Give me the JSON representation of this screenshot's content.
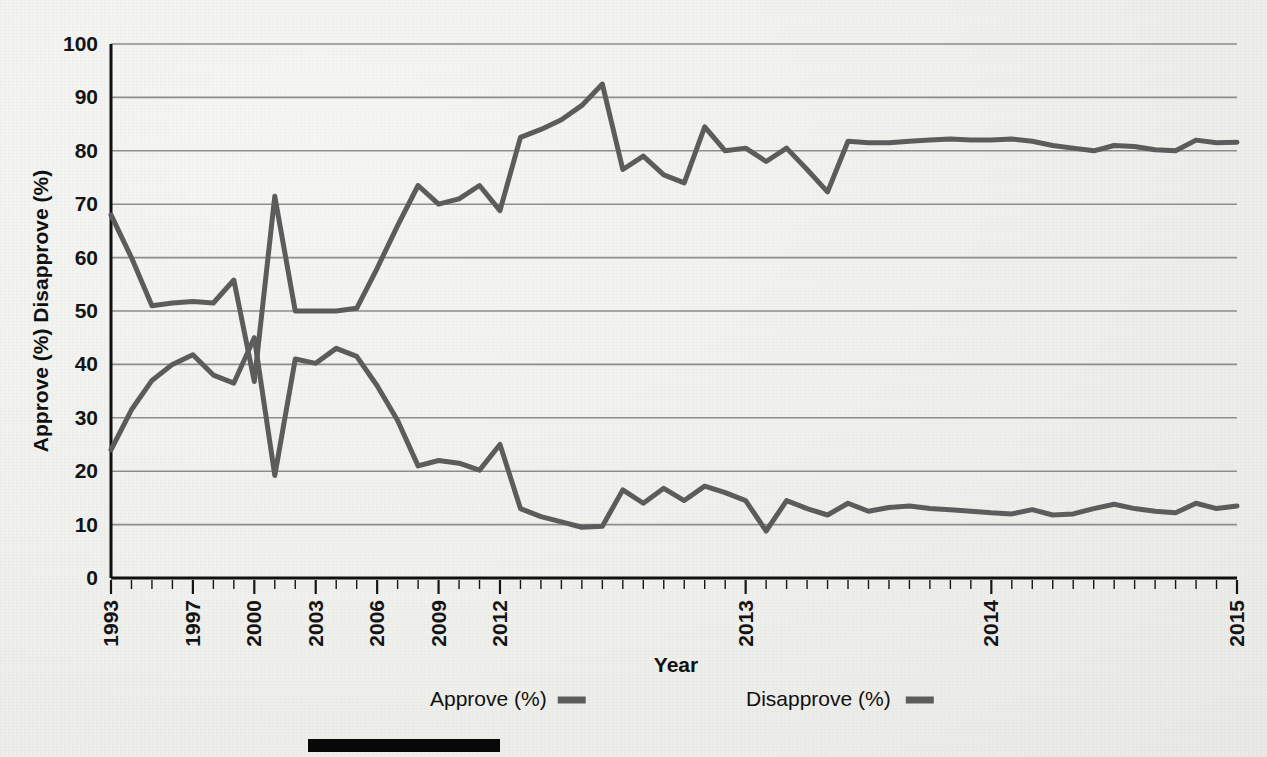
{
  "axes": {
    "y_label": "Approve (%) Disapprove (%)",
    "x_label": "Year",
    "y_ticks": [
      "0",
      "10",
      "20",
      "30",
      "40",
      "50",
      "60",
      "70",
      "80",
      "90",
      "100"
    ],
    "x_ticks": [
      "1993",
      "1997",
      "2000",
      "2003",
      "2006",
      "2009",
      "2012",
      "2013",
      "2014",
      "2015"
    ]
  },
  "legend": {
    "items": [
      {
        "label": "Approve (%)",
        "color": "#5c5c5c"
      },
      {
        "label": "Disapprove (%)",
        "color": "#5c5c5c"
      }
    ]
  },
  "colors": {
    "line": "#5c5c5c",
    "grid": "#8d8d8d",
    "axis": "#111111",
    "background": "#f1f1ee",
    "bottom_bar": "#080808"
  },
  "chart_data": {
    "type": "line",
    "title": "",
    "xlabel": "Year",
    "ylabel": "Approve (%) Disapprove (%)",
    "ylim": [
      0,
      100
    ],
    "ytick_step": 10,
    "grid": true,
    "legend_position": "bottom",
    "x_tick_labels": [
      "1993",
      "1997",
      "2000",
      "2003",
      "2006",
      "2009",
      "2012",
      "2013",
      "2014",
      "2015"
    ],
    "x_tick_indices": [
      0,
      4,
      7,
      10,
      13,
      16,
      19,
      31,
      43,
      55
    ],
    "n_points": 56,
    "series": [
      {
        "name": "Approve (%)",
        "values": [
          24.0,
          31.5,
          37.0,
          40.0,
          41.8,
          38.0,
          36.5,
          45.0,
          19.2,
          41.0,
          40.2,
          43.0,
          41.5,
          36.0,
          29.5,
          21.0,
          22.0,
          21.5,
          20.2,
          25.0,
          13.0,
          11.5,
          10.5,
          9.5,
          9.7,
          16.5,
          14.0,
          16.8,
          14.5,
          17.2,
          16.0,
          14.5,
          8.8,
          14.5,
          13.0,
          11.8,
          14.0,
          12.5,
          13.2,
          13.5,
          13.0,
          12.8,
          12.5,
          12.2,
          12.0,
          12.8,
          11.8,
          12.0,
          13.0,
          13.8,
          13.0,
          12.5,
          12.2,
          14.0,
          13.0,
          13.5
        ]
      },
      {
        "name": "Disapprove (%)",
        "values": [
          68.0,
          60.0,
          51.0,
          51.5,
          51.8,
          51.5,
          55.8,
          36.8,
          71.5,
          50.0,
          50.0,
          50.0,
          50.5,
          58.0,
          66.0,
          73.5,
          70.0,
          71.0,
          73.5,
          68.8,
          82.5,
          84.0,
          85.8,
          88.5,
          92.5,
          76.5,
          79.0,
          75.5,
          74.0,
          84.5,
          80.0,
          80.5,
          78.0,
          80.5,
          76.5,
          72.3,
          81.8,
          81.5,
          81.5,
          81.8,
          82.0,
          82.2,
          82.0,
          82.0,
          82.2,
          81.8,
          81.0,
          80.5,
          80.0,
          81.0,
          80.8,
          80.2,
          80.0,
          82.0,
          81.5,
          81.6
        ]
      }
    ]
  }
}
